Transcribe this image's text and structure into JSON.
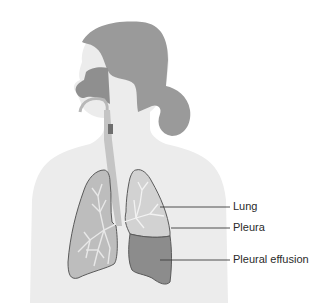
{
  "diagram": {
    "labels": [
      {
        "id": "lung",
        "text": "Lung"
      },
      {
        "id": "pleura",
        "text": "Pleura"
      },
      {
        "id": "pleural-effusion",
        "text": "Pleural effusion"
      }
    ],
    "colors": {
      "body": "#ececec",
      "hair": "#9a9a9a",
      "nasal_cavity": "#8f8f8f",
      "airway": "#c4c4c4",
      "lung_fill": "#bdbdbd",
      "bronchi": "#e8e8e8",
      "effusion": "#8c8c8c",
      "outline": "#5a5a5a",
      "leader_line": "#3c3c3c"
    }
  }
}
